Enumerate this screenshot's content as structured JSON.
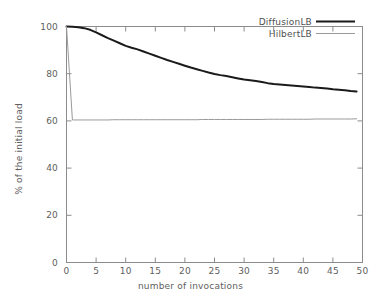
{
  "chart_data": {
    "type": "line",
    "title": "",
    "xlabel": "number of invocations",
    "ylabel": "% of the initial load",
    "xlim": [
      0,
      50
    ],
    "ylim": [
      0,
      100
    ],
    "xticks": [
      0,
      5,
      10,
      15,
      20,
      25,
      30,
      35,
      40,
      45,
      50
    ],
    "xtick_labels": [
      "0",
      "5",
      "10",
      "15",
      "20",
      "25",
      "30",
      "35",
      "40",
      "45",
      "50"
    ],
    "yticks": [
      0,
      20,
      40,
      60,
      80,
      100
    ],
    "ytick_labels": [
      "0",
      "20",
      "40",
      "60",
      "80",
      "100"
    ],
    "grid": false,
    "legend_position": "top-right",
    "series": [
      {
        "name": "DiffusionLB",
        "color": "#1a1a1a",
        "linewidth": 2.0,
        "x": [
          0,
          1,
          2,
          3,
          4,
          5,
          6,
          7,
          8,
          9,
          10,
          11,
          12,
          13,
          14,
          15,
          16,
          17,
          18,
          19,
          20,
          21,
          22,
          23,
          24,
          25,
          26,
          27,
          28,
          29,
          30,
          31,
          32,
          33,
          34,
          35,
          36,
          37,
          38,
          39,
          40,
          41,
          42,
          43,
          44,
          45,
          46,
          47,
          48,
          49
        ],
        "values": [
          100.0,
          99.9,
          99.7,
          99.3,
          98.6,
          97.5,
          96.3,
          95.1,
          94.0,
          92.9,
          91.8,
          91.0,
          90.3,
          89.4,
          88.5,
          87.6,
          86.7,
          85.8,
          85.0,
          84.2,
          83.4,
          82.6,
          81.9,
          81.2,
          80.5,
          79.9,
          79.4,
          79.0,
          78.5,
          78.0,
          77.5,
          77.2,
          76.9,
          76.5,
          76.0,
          75.6,
          75.4,
          75.2,
          75.0,
          74.8,
          74.6,
          74.4,
          74.1,
          73.9,
          73.7,
          73.4,
          73.2,
          73.0,
          72.7,
          72.5
        ]
      },
      {
        "name": "HilbertLB",
        "color": "#9a9a9a",
        "linewidth": 1.0,
        "x": [
          0,
          1,
          2,
          3,
          4,
          5,
          6,
          7,
          8,
          9,
          10,
          11,
          12,
          13,
          14,
          15,
          16,
          17,
          18,
          19,
          20,
          21,
          22,
          23,
          24,
          25,
          26,
          27,
          28,
          29,
          30,
          31,
          32,
          33,
          34,
          35,
          36,
          37,
          38,
          39,
          40,
          41,
          42,
          43,
          44,
          45,
          46,
          47,
          48,
          49
        ],
        "values": [
          100.0,
          60.4,
          60.4,
          60.4,
          60.4,
          60.4,
          60.4,
          60.4,
          60.5,
          60.5,
          60.5,
          60.5,
          60.5,
          60.5,
          60.5,
          60.5,
          60.5,
          60.5,
          60.5,
          60.5,
          60.5,
          60.5,
          60.5,
          60.6,
          60.6,
          60.6,
          60.6,
          60.6,
          60.6,
          60.6,
          60.6,
          60.6,
          60.6,
          60.6,
          60.7,
          60.7,
          60.7,
          60.7,
          60.7,
          60.7,
          60.7,
          60.7,
          60.8,
          60.8,
          60.8,
          60.8,
          60.8,
          60.8,
          60.8,
          60.9
        ]
      }
    ],
    "legend": [
      {
        "label": "DiffusionLB",
        "color": "#1a1a1a",
        "linewidth": 2.0
      },
      {
        "label": "HilbertLB",
        "color": "#9a9a9a",
        "linewidth": 1.0
      }
    ],
    "colors": {
      "axis": "#8c8c8c",
      "text": "#606060",
      "background": "#ffffff"
    }
  }
}
